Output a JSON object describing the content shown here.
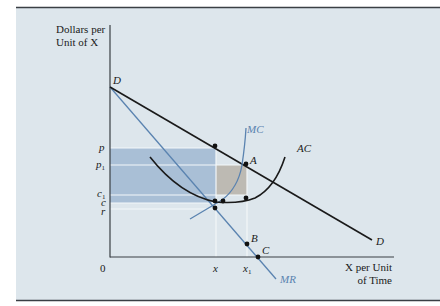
{
  "figure": {
    "y_axis_label_line1": "Dollars per",
    "y_axis_label_line2": "Unit of X",
    "x_axis_label_line1": "X per Unit",
    "x_axis_label_line2": "of Time",
    "origin_label": "0",
    "colors": {
      "panel_bg": "#dde6ec",
      "border": "#3a3f44",
      "black_curve": "#1a1a1a",
      "blue_curve": "#5a83b0",
      "blue_shade": "#a9bfd6",
      "gray_shade": "#bdbab3",
      "guide_line": "#f4f7f9"
    },
    "price_ticks": [
      {
        "label": "p",
        "sub": ""
      },
      {
        "label": "p",
        "sub": "1"
      },
      {
        "label": "c",
        "sub": "1"
      },
      {
        "label": "c",
        "sub": ""
      },
      {
        "label": "r",
        "sub": ""
      }
    ],
    "quantity_ticks": [
      {
        "label": "x",
        "sub": ""
      },
      {
        "label": "x",
        "sub": "1"
      }
    ],
    "curve_labels": {
      "demand_top": "D",
      "demand_end": "D",
      "mc": "MC",
      "ac": "AC",
      "mr": "MR"
    },
    "point_labels": {
      "A": "A",
      "B": "B",
      "C": "C"
    }
  }
}
